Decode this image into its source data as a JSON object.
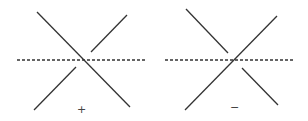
{
  "diagrams": [
    {
      "name": "positive-crossing",
      "sign": "+",
      "over_strand": "top-left to bottom-right",
      "under_strand": "bottom-left to top-right"
    },
    {
      "name": "negative-crossing",
      "sign": "−",
      "over_strand": "bottom-left to top-right",
      "under_strand": "top-left to bottom-right"
    }
  ],
  "colors": {
    "stroke": "#333333",
    "dashed": "#333333"
  }
}
